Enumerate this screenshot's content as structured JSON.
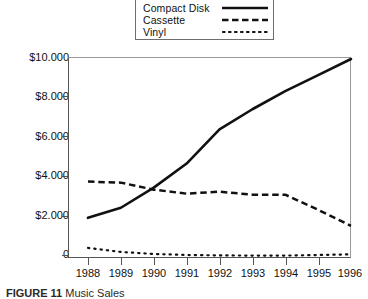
{
  "figure": {
    "caption_label": "FIGURE 11",
    "caption_text": "Music Sales"
  },
  "legend": {
    "position": "top-center",
    "items": [
      {
        "label": "Compact Disk",
        "style": "solid",
        "swatch": "solid-line-swatch"
      },
      {
        "label": "Cassette",
        "style": "dashed",
        "swatch": "dashed-line-swatch"
      },
      {
        "label": "Vinyl",
        "style": "dotted",
        "swatch": "dotted-line-swatch"
      }
    ]
  },
  "axes": {
    "y_tick_labels": [
      "$10.000",
      "$8.000",
      "$6.000",
      "$4.000",
      "$2.000",
      "0"
    ],
    "x_tick_labels": [
      "1988",
      "1989",
      "1990",
      "1991",
      "1992",
      "1993",
      "1994",
      "1995",
      "1996"
    ]
  },
  "chart_data": {
    "type": "line",
    "title": "",
    "xlabel": "",
    "ylabel": "",
    "categories": [
      "1988",
      "1989",
      "1990",
      "1991",
      "1992",
      "1993",
      "1994",
      "1995",
      "1996"
    ],
    "x": [
      1988,
      1989,
      1990,
      1991,
      1992,
      1993,
      1994,
      1995,
      1996
    ],
    "ylim": [
      0,
      10000
    ],
    "xlim": [
      1988,
      1996
    ],
    "y_ticks": [
      0,
      2000,
      4000,
      6000,
      8000,
      10000
    ],
    "grid": false,
    "legend_position": "top-center",
    "series": [
      {
        "name": "Compact Disk",
        "style": "solid",
        "color": "#111111",
        "values": [
          2000,
          2500,
          3500,
          4700,
          6400,
          7400,
          8300,
          9100,
          9900
        ]
      },
      {
        "name": "Cassette",
        "style": "dashed",
        "color": "#111111",
        "values": [
          3800,
          3750,
          3400,
          3200,
          3300,
          3150,
          3150,
          2400,
          1600
        ]
      },
      {
        "name": "Vinyl",
        "style": "dotted",
        "color": "#111111",
        "values": [
          500,
          300,
          200,
          150,
          130,
          120,
          120,
          150,
          180
        ]
      }
    ]
  },
  "colors": {
    "line": "#111111",
    "axis": "#555555",
    "frame_light": "#9a9a9a",
    "background": "#ffffff"
  }
}
